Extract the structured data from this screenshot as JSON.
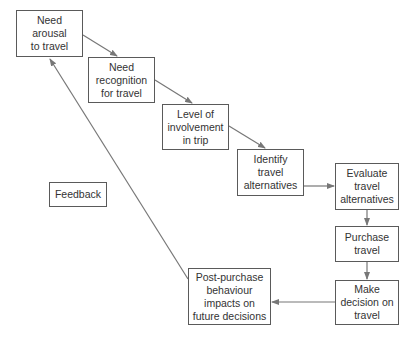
{
  "diagram": {
    "type": "flowchart",
    "colors": {
      "box_border": "#5a5a5a",
      "arrow": "#777777",
      "text": "#333333",
      "background": "#ffffff"
    },
    "nodes": [
      {
        "id": "n1",
        "label": "Need\narousal\nto travel"
      },
      {
        "id": "n2",
        "label": "Need\nrecognition\nfor travel"
      },
      {
        "id": "n3",
        "label": "Level of\ninvolvement\nin trip"
      },
      {
        "id": "n4",
        "label": "Identify\ntravel\nalternatives"
      },
      {
        "id": "n5",
        "label": "Evaluate\ntravel\nalternatives"
      },
      {
        "id": "n6",
        "label": "Purchase\ntravel"
      },
      {
        "id": "n7",
        "label": "Make\ndecision on\ntravel"
      },
      {
        "id": "n8",
        "label": "Post-purchase\nbehaviour\nimpacts on\nfuture decisions"
      },
      {
        "id": "feedback",
        "label": "Feedback"
      }
    ],
    "edges": [
      {
        "from": "n1",
        "to": "n2"
      },
      {
        "from": "n2",
        "to": "n3"
      },
      {
        "from": "n3",
        "to": "n4"
      },
      {
        "from": "n4",
        "to": "n5"
      },
      {
        "from": "n5",
        "to": "n6"
      },
      {
        "from": "n6",
        "to": "n7"
      },
      {
        "from": "n7",
        "to": "n8"
      },
      {
        "from": "n8",
        "to": "n1",
        "label": "Feedback"
      }
    ]
  }
}
